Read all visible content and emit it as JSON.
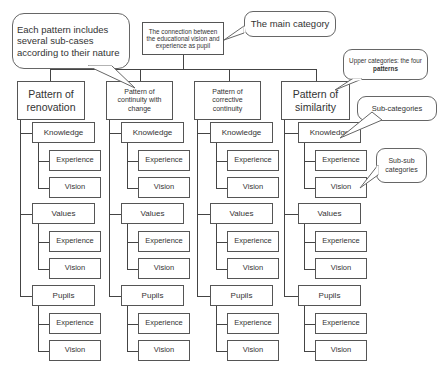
{
  "root": {
    "label": "The connection between the educational vision and experience as pupil"
  },
  "patterns": [
    {
      "label": "Pattern of renovation"
    },
    {
      "label": "Pattern of continuity with change"
    },
    {
      "label": "Pattern of corrective continuity"
    },
    {
      "label": "Pattern of similarity"
    }
  ],
  "sub_categories": [
    "Knowledge",
    "Values",
    "Pupils"
  ],
  "sub_sub_categories": [
    "Experience",
    "Vision"
  ],
  "callouts": {
    "sub_cases": "Each pattern includes several sub-cases according to their nature",
    "main_category": "The main category",
    "upper_categories_prefix": "Upper categories: the four ",
    "upper_categories_bold": "patterns",
    "sub_categories": "Sub-categories",
    "sub_sub_categories": "Sub-sub categories"
  }
}
